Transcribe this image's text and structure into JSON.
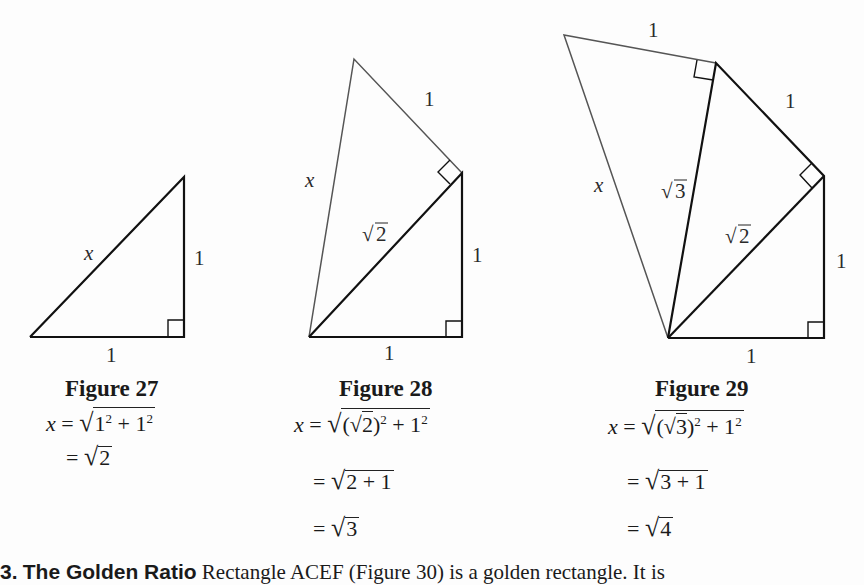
{
  "figures": [
    {
      "id": "fig27",
      "caption": "Figure 27",
      "labels": {
        "hyp": "x",
        "right": "1",
        "bottom": "1"
      },
      "equations": [
        "x = √(1² + 1²)",
        "= √2"
      ],
      "eq_parts": {
        "l1_x": "x",
        "l1_eq": "=",
        "l1_rad": "1",
        "l1_plus": "+ 1",
        "l2_eq": "=",
        "l2_rad": "2"
      }
    },
    {
      "id": "fig28",
      "caption": "Figure 28",
      "labels": {
        "x": "x",
        "top": "1",
        "sqrt2": "2",
        "right": "1",
        "bottom": "1"
      },
      "equations": [
        "x = √((√2)² + 1²)",
        "= √(2 + 1)",
        "= √3"
      ],
      "eq_parts": {
        "l1_x": "x",
        "l1_eq": "=",
        "l1_inner": "2",
        "l1_plus": "+ 1",
        "l2_eq": "=",
        "l2_rad": "2 + 1",
        "l3_eq": "=",
        "l3_rad": "3"
      }
    },
    {
      "id": "fig29",
      "caption": "Figure 29",
      "labels": {
        "x": "x",
        "top": "1",
        "upper_right": "1",
        "sqrt3": "3",
        "sqrt2": "2",
        "right": "1",
        "bottom": "1"
      },
      "equations": [
        "x = √((√3)² + 1²)",
        "= √(3 + 1)",
        "= √4"
      ],
      "eq_parts": {
        "l1_x": "x",
        "l1_eq": "=",
        "l1_inner": "3",
        "l1_plus": "+ 1",
        "l2_eq": "=",
        "l2_rad": "3 + 1",
        "l3_eq": "=",
        "l3_rad": "4"
      }
    }
  ],
  "bottom_text": {
    "number": "3.",
    "heading": "The Golden Ratio",
    "body": "Rectangle ACEF (Figure 30) is a golden rectangle. It is"
  },
  "symbols": {
    "radical": "√",
    "squared": "2"
  }
}
